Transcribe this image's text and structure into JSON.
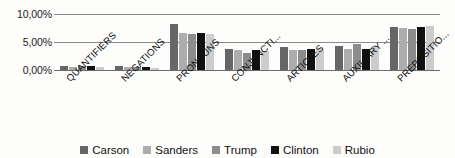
{
  "chart_data": {
    "type": "bar",
    "title": "",
    "subtitle": "",
    "xlabel": "",
    "ylabel": "",
    "ylim": [
      0,
      10
    ],
    "ytick_labels": [
      "0,00%",
      "5,00%",
      "10,00%"
    ],
    "ytick_values": [
      0,
      5,
      10
    ],
    "grid": true,
    "legend_position": "bottom",
    "categories": [
      "QUANTIFIERS",
      "NEGATIONS",
      "PRONOUNS",
      "CONJUNCTI...",
      "ARTICLES",
      "AUXILIARY ...",
      "PREPOSITIO..."
    ],
    "series": [
      {
        "name": "Carson",
        "color": "#666666",
        "values": [
          0.8,
          0.65,
          8.2,
          3.75,
          4.15,
          4.35,
          7.6
        ]
      },
      {
        "name": "Sanders",
        "color": "#adadad",
        "values": [
          0.6,
          0.45,
          6.6,
          3.6,
          3.65,
          3.7,
          7.55
        ]
      },
      {
        "name": "Trump",
        "color": "#8c8c8c",
        "values": [
          0.65,
          0.5,
          6.5,
          3.1,
          3.5,
          4.7,
          7.25
        ]
      },
      {
        "name": "Clinton",
        "color": "#111111",
        "values": [
          0.75,
          0.55,
          6.6,
          3.5,
          3.7,
          3.7,
          7.75
        ]
      },
      {
        "name": "Rubio",
        "color": "#cccccc",
        "values": [
          0.45,
          0.35,
          6.35,
          3.4,
          3.75,
          4.35,
          7.85
        ]
      }
    ]
  },
  "axis": {
    "ticks": [
      {
        "label": "10,00%",
        "value": 10
      },
      {
        "label": "5,00%",
        "value": 5
      },
      {
        "label": "0,00%",
        "value": 0
      }
    ]
  },
  "legend": {
    "items": [
      {
        "label": "Carson",
        "color": "#666666"
      },
      {
        "label": "Sanders",
        "color": "#adadad"
      },
      {
        "label": "Trump",
        "color": "#8c8c8c"
      },
      {
        "label": "Clinton",
        "color": "#111111"
      },
      {
        "label": "Rubio",
        "color": "#cccccc"
      }
    ]
  }
}
